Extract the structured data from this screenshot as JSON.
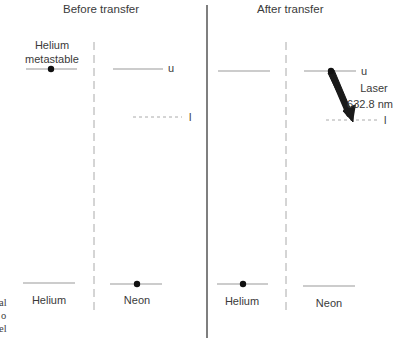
{
  "panels": [
    {
      "title": "Before transfer",
      "helium": {
        "upper_label_line1": "Helium",
        "upper_label_line2": "metastable",
        "ground_label": "Helium",
        "electron_on": "upper"
      },
      "neon": {
        "ground_label": "Neon",
        "upper_level_label": "u",
        "lower_level_label": "l",
        "electron_on": "ground"
      }
    },
    {
      "title": "After transfer",
      "helium": {
        "ground_label": "Helium",
        "electron_on": "ground"
      },
      "neon": {
        "ground_label": "Neon",
        "upper_level_label": "u",
        "lower_level_label": "l",
        "electron_on": "upper",
        "transition_label_line1": "Laser",
        "transition_label_line2": "632.8 nm"
      }
    }
  ],
  "clipped_left_text": [
    "al",
    "o",
    "el"
  ],
  "colors": {
    "text": "#3a3a3a",
    "level_line": "#999999",
    "divider": "#555555",
    "dashed_divider": "#aaaaaa",
    "electron": "#111111",
    "arrow": "#1a1a1a"
  }
}
